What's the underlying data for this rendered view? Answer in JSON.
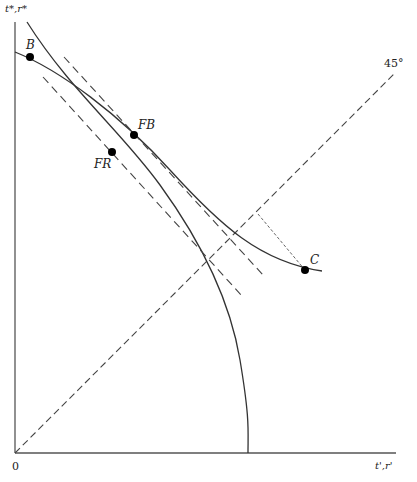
{
  "figure": {
    "y_axis_label": "t*,r*",
    "x_axis_label": "t',r'",
    "origin_label": "0",
    "line_45_label": "45°"
  },
  "points": {
    "B": {
      "label": "B",
      "x": 30,
      "y": 57
    },
    "FB": {
      "label": "FB",
      "x": 134,
      "y": 135
    },
    "FR": {
      "label": "FR",
      "x": 112,
      "y": 152
    },
    "C": {
      "label": "C",
      "x": 305,
      "y": 270
    }
  },
  "colors": {
    "line": "#333333",
    "axis": "#555555",
    "point": "#000000"
  }
}
